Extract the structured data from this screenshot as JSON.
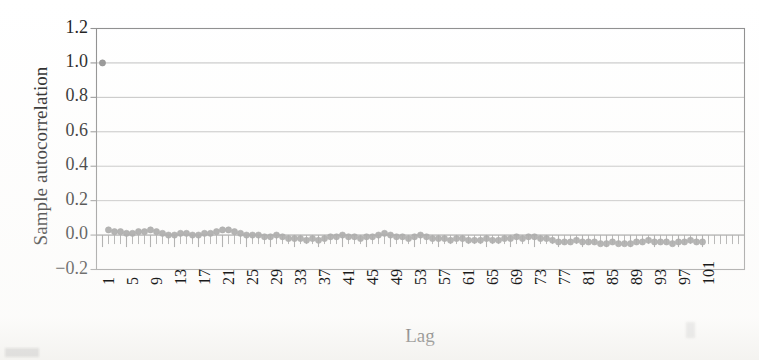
{
  "figure": {
    "background_color": "#ffffff",
    "frame_color": "#8c8c8c",
    "grid_color": "#b4b4b4",
    "marker_color": "#8a8a8a",
    "tick_color": "#8f8f8f",
    "text_color": "#1a1a1a"
  },
  "chart_data": {
    "type": "scatter",
    "title": "",
    "subtitle": "",
    "xlabel": "Lag",
    "ylabel": "Sample autocorrelation",
    "xlim": [
      0,
      108
    ],
    "ylim": [
      -0.2,
      1.2
    ],
    "grid": "horizontal",
    "legend": "none",
    "annotations": [],
    "ytick_labels": [
      "1.2",
      "1.0",
      "0.8",
      "0.6",
      "0.4",
      "0.2",
      "0.0",
      "-0.2"
    ],
    "ytick_values": [
      1.2,
      1.0,
      0.8,
      0.6,
      0.4,
      0.2,
      0.0,
      -0.2
    ],
    "xtick_labels": [
      "1",
      "5",
      "9",
      "13",
      "17",
      "21",
      "25",
      "29",
      "33",
      "37",
      "41",
      "45",
      "49",
      "53",
      "57",
      "61",
      "65",
      "69",
      "73",
      "77",
      "81",
      "85",
      "89",
      "93",
      "97",
      "101"
    ],
    "xtick_values": [
      1,
      5,
      9,
      13,
      17,
      21,
      25,
      29,
      33,
      37,
      41,
      45,
      49,
      53,
      57,
      61,
      65,
      69,
      73,
      77,
      81,
      85,
      89,
      93,
      97,
      101
    ],
    "x": [
      1,
      2,
      3,
      4,
      5,
      6,
      7,
      8,
      9,
      10,
      11,
      12,
      13,
      14,
      15,
      16,
      17,
      18,
      19,
      20,
      21,
      22,
      23,
      24,
      25,
      26,
      27,
      28,
      29,
      30,
      31,
      32,
      33,
      34,
      35,
      36,
      37,
      38,
      39,
      40,
      41,
      42,
      43,
      44,
      45,
      46,
      47,
      48,
      49,
      50,
      51,
      52,
      53,
      54,
      55,
      56,
      57,
      58,
      59,
      60,
      61,
      62,
      63,
      64,
      65,
      66,
      67,
      68,
      69,
      70,
      71,
      72,
      73,
      74,
      75,
      76,
      77,
      78,
      79,
      80,
      81,
      82,
      83,
      84,
      85,
      86,
      87,
      88,
      89,
      90,
      91,
      92,
      93,
      94,
      95,
      96,
      97,
      98,
      99,
      100,
      101
    ],
    "y": [
      1.0,
      0.03,
      0.02,
      0.02,
      0.01,
      0.01,
      0.02,
      0.02,
      0.03,
      0.02,
      0.01,
      0.0,
      0.0,
      0.01,
      0.01,
      0.0,
      0.0,
      0.01,
      0.01,
      0.02,
      0.03,
      0.03,
      0.02,
      0.01,
      0.0,
      0.0,
      0.0,
      -0.01,
      -0.01,
      0.0,
      -0.01,
      -0.02,
      -0.02,
      -0.02,
      -0.03,
      -0.02,
      -0.03,
      -0.02,
      -0.01,
      -0.01,
      0.0,
      -0.01,
      -0.01,
      -0.02,
      -0.01,
      -0.01,
      0.0,
      0.01,
      0.0,
      -0.01,
      -0.01,
      -0.02,
      -0.01,
      0.0,
      -0.01,
      -0.02,
      -0.02,
      -0.02,
      -0.03,
      -0.02,
      -0.02,
      -0.03,
      -0.03,
      -0.03,
      -0.02,
      -0.03,
      -0.03,
      -0.02,
      -0.02,
      -0.01,
      -0.02,
      -0.01,
      -0.01,
      -0.02,
      -0.02,
      -0.03,
      -0.04,
      -0.04,
      -0.04,
      -0.03,
      -0.04,
      -0.04,
      -0.04,
      -0.05,
      -0.05,
      -0.04,
      -0.05,
      -0.05,
      -0.05,
      -0.04,
      -0.04,
      -0.03,
      -0.04,
      -0.04,
      -0.04,
      -0.05,
      -0.04,
      -0.04,
      -0.03,
      -0.04,
      -0.04
    ],
    "marker": "circle",
    "marker_size": 5,
    "series": [
      {
        "name": "sample autocorrelation",
        "color": "#8a8a8a"
      }
    ]
  }
}
